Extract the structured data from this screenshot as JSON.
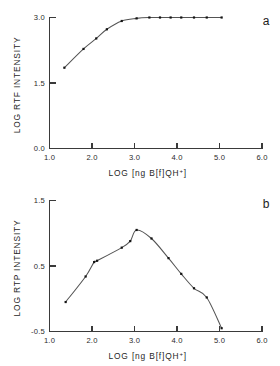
{
  "figure": {
    "panels": [
      {
        "letter": "a",
        "xlabel_prefix": "LOG  [ng B[f]QH",
        "xlabel_sup": "+",
        "xlabel_suffix": "]",
        "ylabel": "LOG RTF INTENSITY",
        "xticks": [
          "1.0",
          "2.0",
          "3.0",
          "4.0",
          "5.0",
          "6.0"
        ],
        "yticks": [
          "0.0",
          "1.5",
          "3.0"
        ]
      },
      {
        "letter": "b",
        "xlabel_prefix": "LOG  [ng B[f]QH",
        "xlabel_sup": "+",
        "xlabel_suffix": "]",
        "ylabel": "LOG RTP INTENSITY",
        "xticks": [
          "1.0",
          "2.0",
          "3.0",
          "4.0",
          "5.0",
          "6.0"
        ],
        "yticks": [
          "-0.5",
          "0.5",
          "1.5"
        ]
      }
    ]
  },
  "chart_data": [
    {
      "type": "line",
      "panel": "a",
      "title": "",
      "xlabel": "LOG [ng B[f]QH+]",
      "ylabel": "LOG RTF INTENSITY",
      "xlim": [
        1.0,
        6.0
      ],
      "ylim": [
        0.0,
        3.0
      ],
      "xticks": [
        1.0,
        2.0,
        3.0,
        4.0,
        5.0,
        6.0
      ],
      "yticks": [
        0.0,
        1.5,
        3.0
      ],
      "grid": false,
      "legend": null,
      "marker": "filled-square",
      "series": [
        {
          "name": "RTF intensity",
          "x": [
            1.35,
            1.8,
            2.1,
            2.35,
            2.7,
            3.05,
            3.35,
            3.6,
            3.85,
            4.1,
            4.4,
            4.7,
            5.05
          ],
          "y": [
            1.85,
            2.28,
            2.52,
            2.73,
            2.92,
            2.98,
            3.0,
            3.0,
            3.0,
            3.0,
            3.0,
            3.0,
            3.0
          ]
        }
      ],
      "curve_description": "monotonic rise from 1.85 then saturating plateau at 3.0 beyond LOG 3.0"
    },
    {
      "type": "line",
      "panel": "b",
      "title": "",
      "xlabel": "LOG [ng B[f]QH+]",
      "ylabel": "LOG RTP INTENSITY",
      "xlim": [
        1.0,
        6.0
      ],
      "ylim": [
        -0.5,
        1.5
      ],
      "xticks": [
        1.0,
        2.0,
        3.0,
        4.0,
        5.0,
        6.0
      ],
      "yticks": [
        -0.5,
        0.5,
        1.5
      ],
      "grid": false,
      "legend": null,
      "marker": "filled-square",
      "series": [
        {
          "name": "RTP intensity",
          "x": [
            1.38,
            1.85,
            2.05,
            2.12,
            2.7,
            2.9,
            3.05,
            3.4,
            3.8,
            4.1,
            4.4,
            4.7,
            5.05
          ],
          "y": [
            -0.05,
            0.34,
            0.56,
            0.58,
            0.78,
            0.88,
            1.05,
            0.92,
            0.62,
            0.38,
            0.16,
            0.02,
            -0.45
          ]
        }
      ],
      "curve_description": "inverted-U: rises to maximum near LOG 3.0 (approx 0.97) then falls steeply to -0.45 at LOG 5.1"
    }
  ]
}
